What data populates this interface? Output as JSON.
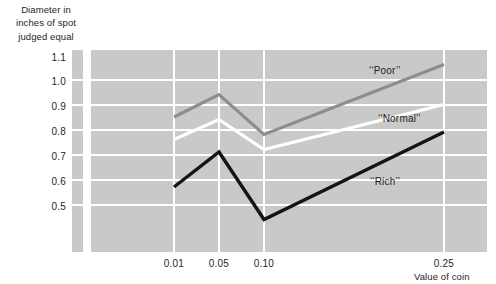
{
  "axes": {
    "y_caption": [
      "Diameter in",
      "inches of spot",
      "judged equal"
    ],
    "x_caption": "Value of coin",
    "y_ticks": [
      "1.1",
      "1.0",
      "0.9",
      "0.8",
      "0.7",
      "0.6",
      "0.5"
    ],
    "x_ticks": [
      "0.01",
      "0.05",
      "0.10",
      "0.25"
    ]
  },
  "series_labels": {
    "poor": "‘‘Poor’’",
    "normal": "‘‘Normal’’",
    "rich": "‘‘Rich’’"
  },
  "colors": {
    "panel": "#c9c9c9",
    "grid": "#ffffff",
    "poor": "#8d8d8d",
    "normal": "#ffffff",
    "rich": "#141414",
    "text": "#1f1f1f"
  },
  "chart_data": {
    "type": "line",
    "title": "",
    "xlabel": "Value of coin",
    "ylabel": "Diameter in inches of spot judged equal",
    "categories": [
      "0.01",
      "0.05",
      "0.10",
      "0.25"
    ],
    "x": [
      0.01,
      0.05,
      0.1,
      0.25
    ],
    "ylim": [
      0.4,
      1.15
    ],
    "yticks": [
      0.5,
      0.6,
      0.7,
      0.8,
      0.9,
      1.0,
      1.1
    ],
    "grid": true,
    "legend": "inline-annotations",
    "series": [
      {
        "name": "‘‘Poor’’",
        "values": [
          0.86,
          0.95,
          0.79,
          1.07
        ],
        "color": "#8d8d8d"
      },
      {
        "name": "‘‘Normal’’",
        "values": [
          0.77,
          0.85,
          0.73,
          0.91
        ],
        "color": "#ffffff"
      },
      {
        "name": "‘‘Rich’’",
        "values": [
          0.58,
          0.72,
          0.45,
          0.8
        ],
        "color": "#141414"
      }
    ]
  }
}
